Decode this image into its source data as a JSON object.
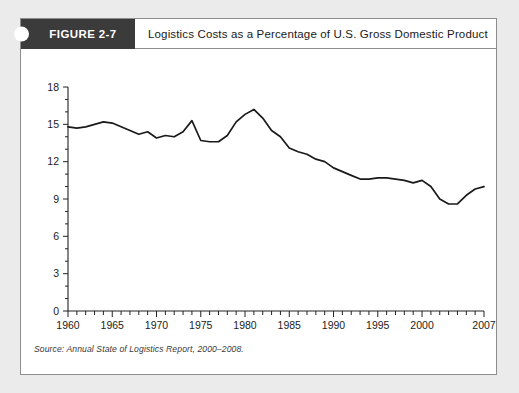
{
  "figure": {
    "tag_label": "FIGURE 2-7",
    "title": "Logistics Costs as a Percentage of U.S. Gross Domestic Product",
    "source_note": "Source: Annual State of Logistics Report, 2000–2008."
  },
  "colors": {
    "page_background": "#ebebeb",
    "card_background": "#ffffff",
    "card_border": "#8d8d8d",
    "tag_background": "#3b3b3b",
    "tag_text": "#ffffff",
    "axis": "#222222",
    "line": "#1a1a1a"
  },
  "chart_data": {
    "type": "line",
    "title": "Logistics Costs as a Percentage of U.S. Gross Domestic Product",
    "xlabel": "",
    "ylabel": "",
    "xlim": [
      1960,
      2007
    ],
    "ylim": [
      0,
      18
    ],
    "grid": false,
    "legend": null,
    "y_ticks": [
      0,
      3,
      6,
      9,
      12,
      15,
      18
    ],
    "y_tick_labels": [
      "0",
      "3",
      "6",
      "9",
      "12",
      "15",
      "18"
    ],
    "y_minor_tick_step": 1,
    "x_ticks": [
      1960,
      1965,
      1970,
      1975,
      1980,
      1985,
      1990,
      1995,
      2000,
      2007
    ],
    "x_tick_labels": [
      "1960",
      "1965",
      "1970",
      "1975",
      "1980",
      "1985",
      "1990",
      "1995",
      "2000",
      "2007"
    ],
    "x_minor_tick_step": 1,
    "x": [
      1960,
      1961,
      1962,
      1963,
      1964,
      1965,
      1966,
      1967,
      1968,
      1969,
      1970,
      1971,
      1972,
      1973,
      1974,
      1975,
      1976,
      1977,
      1978,
      1979,
      1980,
      1981,
      1982,
      1983,
      1984,
      1985,
      1986,
      1987,
      1988,
      1989,
      1990,
      1991,
      1992,
      1993,
      1994,
      1995,
      1996,
      1997,
      1998,
      1999,
      2000,
      2001,
      2002,
      2003,
      2004,
      2005,
      2006,
      2007
    ],
    "values": [
      14.8,
      14.7,
      14.8,
      15.0,
      15.2,
      15.1,
      14.8,
      14.5,
      14.2,
      14.4,
      13.9,
      14.1,
      14.0,
      14.4,
      15.3,
      13.7,
      13.6,
      13.6,
      14.1,
      15.2,
      15.8,
      16.2,
      15.5,
      14.5,
      14.0,
      13.1,
      12.8,
      12.6,
      12.2,
      12.0,
      11.5,
      11.2,
      10.9,
      10.6,
      10.6,
      10.7,
      10.7,
      10.6,
      10.5,
      10.3,
      10.5,
      10.0,
      9.0,
      8.6,
      8.6,
      9.3,
      9.8,
      10.0
    ],
    "units": "percent of GDP"
  }
}
